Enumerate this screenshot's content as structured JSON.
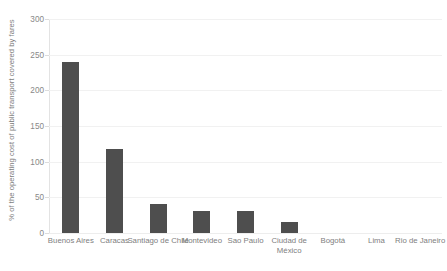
{
  "chart_data": {
    "type": "bar",
    "title": "",
    "subtitle": "",
    "xlabel": "",
    "ylabel": "% of the operating cost of public transport covered by fares",
    "categories": [
      "Buenos Aires",
      "Caracas",
      "Santiago de Chile",
      "Montevideo",
      "Sao Paulo",
      "Ciudad de México",
      "Bogotá",
      "Lima",
      "Rio de Janeiro"
    ],
    "values": [
      240,
      118,
      41,
      31,
      31,
      15,
      0,
      0,
      0
    ],
    "ylim": [
      0,
      300
    ],
    "yticks": [
      0,
      50,
      100,
      150,
      200,
      250,
      300
    ],
    "ytick_labels": [
      "0",
      "50",
      "100",
      "150",
      "200",
      "250",
      "300"
    ],
    "grid": true,
    "legend": false,
    "legend_position": "none",
    "bar_color": "#4e4e4e",
    "gridline_color": "#f1f1f1",
    "axis_color": "#e3e3e3",
    "text_color": "#808080"
  }
}
